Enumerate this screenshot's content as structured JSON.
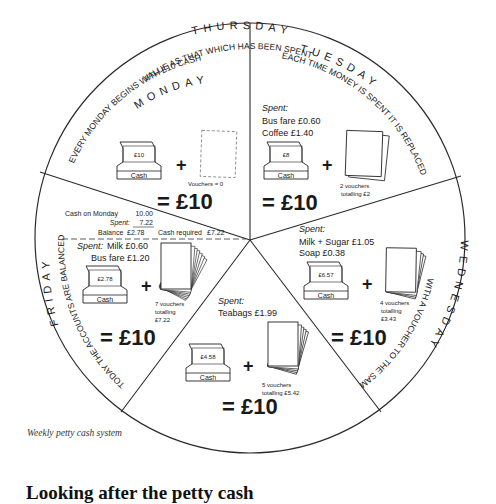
{
  "caption": "Weekly petty cash system",
  "heading": "Looking after the petty cash",
  "wheel": {
    "monday": {
      "day": "MONDAY",
      "rule": "EVERY MONDAY BEGINS WITH £10 CASH",
      "cash": "£10",
      "cash_label": "Cash",
      "plus": "+",
      "vouchers": "Vouchers = 0",
      "total": "= £10"
    },
    "tuesday": {
      "day": "TUESDAY",
      "rule": "EACH TIME MONEY IS SPENT IT IS REPLACED",
      "spent_label": "Spent:",
      "spent_items": [
        "Bus fare £0.60",
        "Coffee £1.40"
      ],
      "cash": "£8",
      "cash_label": "Cash",
      "plus": "+",
      "vouchers_line1": "2 vouchers",
      "vouchers_line2": "totalling £2",
      "total": "= £10"
    },
    "wednesday": {
      "day": "WEDNESDAY",
      "rule": "WITH A VOUCHER TO THE SAME",
      "spent_label": "Spent:",
      "spent_items": [
        "Milk + Sugar £1.05",
        "Soap £0.38"
      ],
      "cash": "£6.57",
      "cash_label": "Cash",
      "plus": "+",
      "vouchers_line1": "4 vouchers",
      "vouchers_line2": "totalling",
      "vouchers_line3": "£3.43",
      "total": "= £10"
    },
    "thursday": {
      "day": "THURSDAY",
      "rule": "VALUE AS THAT WHICH HAS BEEN SPENT",
      "spent_label": "Spent:",
      "spent_items": [
        "Teabags £1.99"
      ],
      "cash": "£4.58",
      "cash_label": "Cash",
      "plus": "+",
      "vouchers_line1": "5 vouchers",
      "vouchers_line2": "totalling £5.42",
      "total": "= £10"
    },
    "friday": {
      "day": "FRIDAY",
      "rule": "TODAY THE ACCOUNTS ARE BALANCED",
      "balance": {
        "cash_on_monday_label": "Cash on Monday",
        "cash_on_monday": "10.00",
        "spent_label": "Spent:",
        "spent": "7.22",
        "balance_label": "Balance",
        "balance": "£2.78",
        "cash_required_label": "Cash required",
        "cash_required": "£7.22"
      },
      "spent_label": "Spent:",
      "spent_items": [
        "Milk £0.60",
        "Bus fare £1.20"
      ],
      "cash": "£2.78",
      "cash_label": "Cash",
      "plus": "+",
      "vouchers_line1": "7 vouchers",
      "vouchers_line2": "totalling",
      "vouchers_line3": "£7.22",
      "total": "= £10"
    }
  }
}
